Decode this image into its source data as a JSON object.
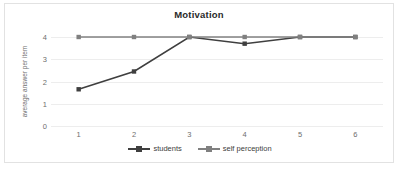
{
  "chart_data": {
    "type": "line",
    "title": "Motivation",
    "xlabel": "",
    "ylabel": "average answer per item",
    "categories": [
      "1",
      "2",
      "3",
      "4",
      "5",
      "6"
    ],
    "yticks": [
      "0",
      "1",
      "2",
      "3",
      "4"
    ],
    "ylim": [
      0,
      4
    ],
    "grid": true,
    "legend_position": "bottom",
    "series": [
      {
        "name": "students",
        "color": "#3f3f3f",
        "marker": "square",
        "values": [
          1.65,
          2.45,
          4.0,
          3.7,
          4.0,
          4.0
        ]
      },
      {
        "name": "self perception",
        "color": "#808080",
        "marker": "square",
        "values": [
          4.0,
          4.0,
          4.0,
          4.0,
          4.0,
          4.0
        ]
      }
    ]
  },
  "colors": {
    "frame_border": "#e2e2e2",
    "gridline": "#ededed",
    "tick_text": "#6e6e6e",
    "title_text": "#2a2a2a",
    "legend_text": "#3d3d3d"
  }
}
